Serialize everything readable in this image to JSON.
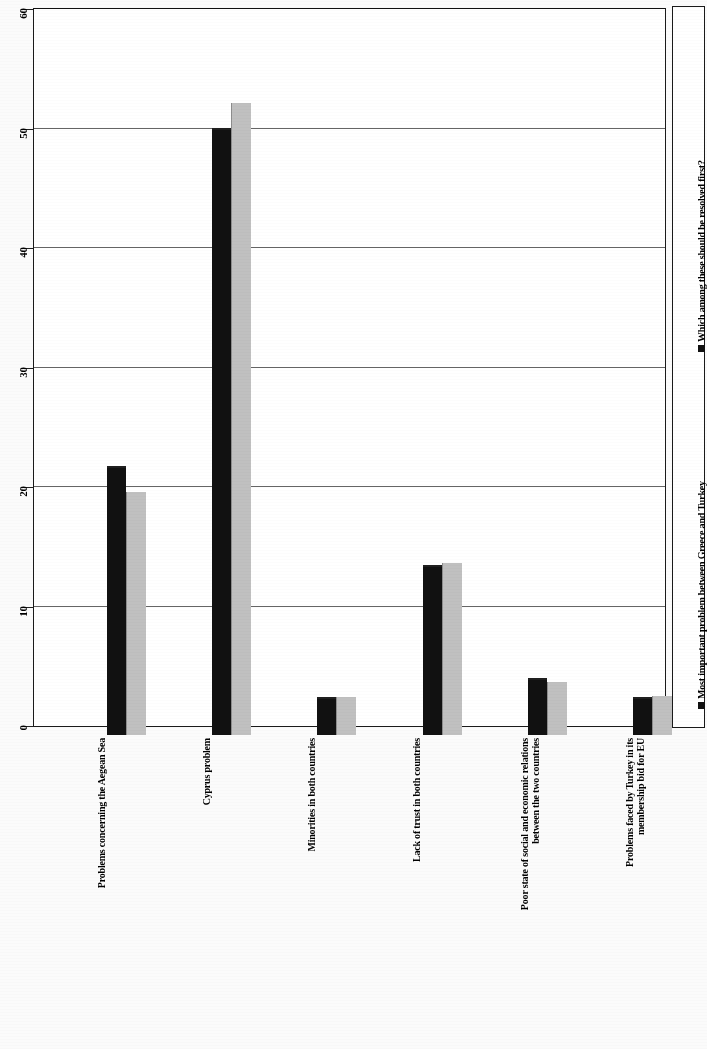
{
  "chart_data": {
    "type": "bar",
    "title": "",
    "xlabel": "",
    "ylabel": "",
    "ylim": [
      0,
      60
    ],
    "ytick_labels": [
      "0",
      "10",
      "20",
      "30",
      "40",
      "50",
      "60"
    ],
    "yticks": [
      0,
      10,
      20,
      30,
      40,
      50,
      60
    ],
    "grid": true,
    "legend_position": "right",
    "orientation": "vertical-bars-rotated-page",
    "categories": [
      "Problems concerning the Aegean Sea",
      "Cyprus problem",
      "Minorities in both countries",
      "Lack of trust in both countries",
      "Poor state of social and economic relations\nbetween the two countries",
      "Problems faced by Turkey in its\nmembership bid for EU"
    ],
    "series": [
      {
        "name": "Most important problem between Greece and Turkey",
        "color": "#111111",
        "values": [
          22.5,
          50.8,
          3.2,
          14.2,
          4.8,
          3.2
        ]
      },
      {
        "name": "Which among these should be resolved first?",
        "color": "#c0c0c0",
        "values": [
          20.3,
          52.9,
          3.2,
          14.4,
          4.4,
          3.3
        ]
      }
    ]
  },
  "legend": {
    "entries": [
      {
        "label": "Most important problem between Greece and Turkey"
      },
      {
        "label": "Which among these should be resolved first?"
      }
    ]
  }
}
